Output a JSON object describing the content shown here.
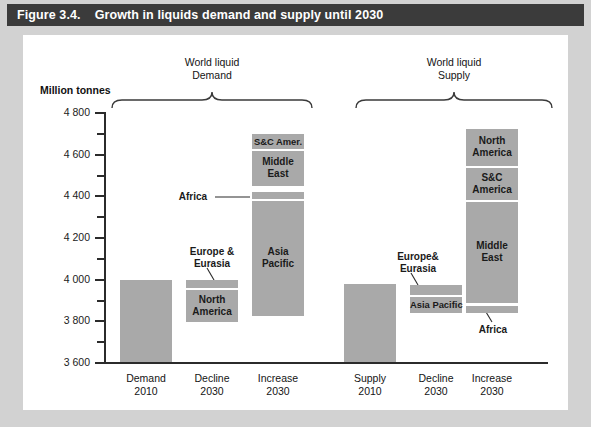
{
  "figure": {
    "number": "Figure 3.4.",
    "title": "Growth in liquids demand and supply until 2030"
  },
  "axis_unit": "Million tonnes",
  "group_headers": [
    {
      "line1": "World liquid",
      "line2": "Demand"
    },
    {
      "line1": "World liquid",
      "line2": "Supply"
    }
  ],
  "ytick_labels": [
    "4 800",
    "4 600",
    "4 400",
    "4 200",
    "4 000",
    "3 800",
    "3 600"
  ],
  "xcat_labels": [
    {
      "line1": "Demand",
      "line2": "2010"
    },
    {
      "line1": "Decline",
      "line2": "2030"
    },
    {
      "line1": "Increase",
      "line2": "2030"
    },
    {
      "line1": "Supply",
      "line2": "2010"
    },
    {
      "line1": "Decline",
      "line2": "2030"
    },
    {
      "line1": "Increase",
      "line2": "2030"
    }
  ],
  "callouts": {
    "demand_europe": "Europe &\nEurasia",
    "demand_africa": "Africa",
    "supply_europe": "Europe&\nEurasia",
    "supply_africa": "Africa"
  },
  "segment_labels": {
    "demand_north_america": "North\nAmerica",
    "demand_asia_pacific": "Asia\nPacific",
    "demand_middle_east": "Middle\nEast",
    "demand_sc_amer": "S&C Amer.",
    "supply_asia_pacific": "Asia Pacific",
    "supply_middle_east": "Middle\nEast",
    "supply_sc_america": "S&C\nAmerica",
    "supply_north_america": "North\nAmerica"
  },
  "colors": {
    "bar_fill": "#a9a9a9",
    "title_bar": "#3b3b3b",
    "panel": "#ffffff",
    "page": "#d2d2d2",
    "axis": "#2b2b2b"
  },
  "chart_data": {
    "type": "bar",
    "title": "Growth in liquids demand and supply until 2030",
    "subtitle": "",
    "xlabel": "",
    "ylabel": "Million tonnes",
    "ylim": [
      3600,
      4800
    ],
    "ytick_step": 200,
    "yminor_step": 100,
    "grid": false,
    "legend": "none",
    "categories": [
      "Demand 2010",
      "Decline 2030",
      "Increase 2030",
      "Supply 2010",
      "Decline 2030",
      "Increase 2030"
    ],
    "bars": [
      {
        "category": "Demand 2010",
        "group": "World liquid Demand",
        "kind": "total",
        "base": 3600,
        "top": 4000,
        "value": 4000,
        "segments": [
          {
            "name": "Demand 2010",
            "from": 3600,
            "to": 4000,
            "value": 400
          }
        ]
      },
      {
        "category": "Decline 2030",
        "group": "World liquid Demand",
        "kind": "stacked",
        "base": 3800,
        "top": 4000,
        "value": 200,
        "segments": [
          {
            "name": "North America",
            "from": 3800,
            "to": 3955,
            "value": 155
          },
          {
            "name": "Europe & Eurasia",
            "from": 3963,
            "to": 4000,
            "value": 37
          }
        ]
      },
      {
        "category": "Increase 2030",
        "group": "World liquid Demand",
        "kind": "stacked",
        "base": 3840,
        "top": 4690,
        "value": 850,
        "segments": [
          {
            "name": "Asia Pacific",
            "from": 3840,
            "to": 4398,
            "value": 558
          },
          {
            "name": "Africa",
            "from": 4406,
            "to": 4436,
            "value": 30
          },
          {
            "name": "Middle East",
            "from": 4444,
            "to": 4610,
            "value": 166
          },
          {
            "name": "S&C Amer.",
            "from": 4618,
            "to": 4690,
            "value": 72
          }
        ]
      },
      {
        "category": "Supply 2010",
        "group": "World liquid Supply",
        "kind": "total",
        "base": 3600,
        "top": 3977,
        "value": 3977,
        "segments": [
          {
            "name": "Supply 2010",
            "from": 3600,
            "to": 3977,
            "value": 377
          }
        ]
      },
      {
        "category": "Decline 2030",
        "group": "World liquid Supply",
        "kind": "stacked",
        "base": 3855,
        "top": 3988,
        "value": 133,
        "segments": [
          {
            "name": "Asia Pacific",
            "from": 3855,
            "to": 3933,
            "value": 78
          },
          {
            "name": "Europe& Eurasia",
            "from": 3941,
            "to": 3988,
            "value": 47
          }
        ]
      },
      {
        "category": "Increase 2030",
        "group": "World liquid Supply",
        "kind": "stacked",
        "base": 3840,
        "top": 4715,
        "value": 875,
        "segments": [
          {
            "name": "Africa",
            "from": 3840,
            "to": 3872,
            "value": 32
          },
          {
            "name": "Middle East",
            "from": 3880,
            "to": 4368,
            "value": 488
          },
          {
            "name": "S&C America",
            "from": 4376,
            "to": 4528,
            "value": 152
          },
          {
            "name": "North America",
            "from": 4536,
            "to": 4715,
            "value": 179
          }
        ]
      }
    ]
  }
}
